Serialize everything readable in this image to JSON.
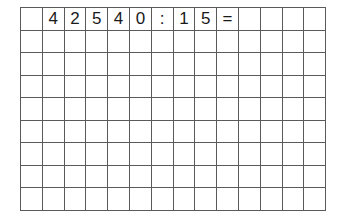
{
  "worksheet": {
    "columns": 14,
    "rows": 9,
    "grid_line_color": "#5a5a5a",
    "text_color": "#1a1a1a",
    "cells": [
      [
        "",
        "4",
        "2",
        "5",
        "4",
        "0",
        ":",
        "1",
        "5",
        "=",
        "",
        "",
        "",
        ""
      ],
      [
        "",
        "",
        "",
        "",
        "",
        "",
        "",
        "",
        "",
        "",
        "",
        "",
        "",
        ""
      ],
      [
        "",
        "",
        "",
        "",
        "",
        "",
        "",
        "",
        "",
        "",
        "",
        "",
        "",
        ""
      ],
      [
        "",
        "",
        "",
        "",
        "",
        "",
        "",
        "",
        "",
        "",
        "",
        "",
        "",
        ""
      ],
      [
        "",
        "",
        "",
        "",
        "",
        "",
        "",
        "",
        "",
        "",
        "",
        "",
        "",
        ""
      ],
      [
        "",
        "",
        "",
        "",
        "",
        "",
        "",
        "",
        "",
        "",
        "",
        "",
        "",
        ""
      ],
      [
        "",
        "",
        "",
        "",
        "",
        "",
        "",
        "",
        "",
        "",
        "",
        "",
        "",
        ""
      ],
      [
        "",
        "",
        "",
        "",
        "",
        "",
        "",
        "",
        "",
        "",
        "",
        "",
        "",
        ""
      ],
      [
        "",
        "",
        "",
        "",
        "",
        "",
        "",
        "",
        "",
        "",
        "",
        "",
        "",
        ""
      ]
    ]
  }
}
